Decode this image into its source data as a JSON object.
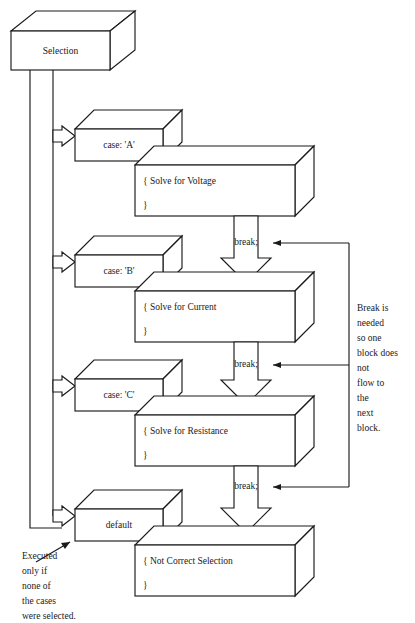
{
  "diagram": {
    "root": {
      "label": "Selection"
    },
    "cases": [
      {
        "case_label": "case: 'A'",
        "body_open": "{ Solve for Voltage",
        "body_close": "}",
        "break_label": "break;"
      },
      {
        "case_label": "case: 'B'",
        "body_open": "{ Solve for Current",
        "body_close": "}",
        "break_label": "break;"
      },
      {
        "case_label": "case: 'C'",
        "body_open": "{ Solve for Resistance",
        "body_close": "}",
        "break_label": "break;"
      }
    ],
    "default_case": {
      "case_label": "default",
      "body_open": "{ Not Correct Selection",
      "body_close": "}"
    },
    "notes": {
      "right_note_lines": [
        "Break is",
        "needed",
        "so one",
        "block does",
        "not",
        "flow to",
        "the",
        "next",
        "block."
      ],
      "bottom_left_note_lines": [
        "Executed",
        "only if",
        "none of",
        "the cases",
        "were selected."
      ]
    },
    "colors": {
      "stroke": "#1a1a1a",
      "fill": "#ffffff",
      "background": "#ffffff"
    }
  }
}
